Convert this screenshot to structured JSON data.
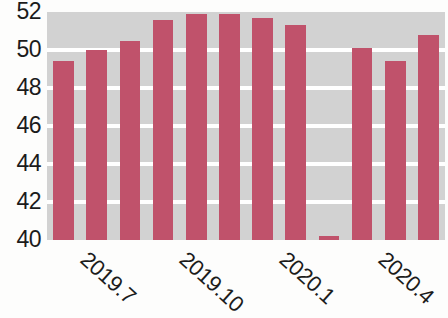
{
  "chart_data": {
    "type": "bar",
    "title": "",
    "subtitle": "",
    "xlabel": "",
    "ylabel": "",
    "ylim": [
      40,
      52
    ],
    "grid": true,
    "legend": null,
    "bar_color": "#c0526b",
    "plot_background": "#d2d2d2",
    "gridline_color": "#ffffff",
    "y_ticks": [
      40,
      42,
      44,
      46,
      48,
      50,
      52
    ],
    "y_tick_labels": [
      "40",
      "42",
      "44",
      "46",
      "48",
      "50",
      "52"
    ],
    "x_tick_labels": [
      "2019.7",
      "2019.10",
      "2020.1",
      "2020.4"
    ],
    "x_tick_bar_index": [
      1,
      4,
      7,
      10
    ],
    "categories": [
      "1",
      "2",
      "3",
      "4",
      "5",
      "6",
      "7",
      "8",
      "9",
      "10",
      "11",
      "12"
    ],
    "values": [
      49.4,
      50.0,
      50.5,
      51.6,
      51.9,
      51.9,
      51.7,
      51.3,
      40.2,
      50.1,
      49.4,
      50.8
    ]
  }
}
